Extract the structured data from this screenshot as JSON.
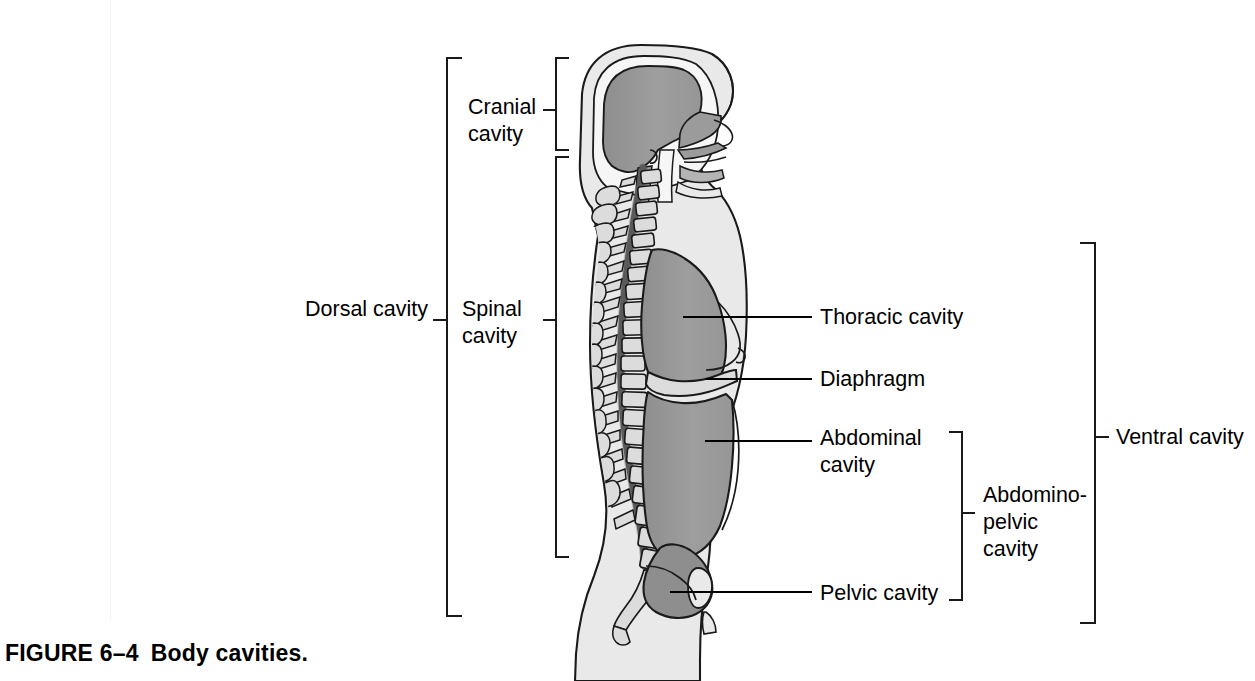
{
  "figure": {
    "caption_number": "FIGURE 6–4",
    "caption_title": "Body cavities."
  },
  "colors": {
    "background": "#ffffff",
    "body_fill": "#e9e9e9",
    "body_outline": "#1a1a1a",
    "cavity_fill": "#9b9b9b",
    "cavity_fill_dark": "#8e8e8e",
    "bone_fill": "#dcdcdc",
    "spinal_canal": "#6f6f6f",
    "label_text": "#000000",
    "leader_line": "#000000",
    "bracket_line": "#1a1a1a",
    "scan_artifact": "#f4f4f4"
  },
  "labels": {
    "dorsal_cavity": "Dorsal cavity",
    "cranial_cavity": "Cranial\ncavity",
    "spinal_cavity": "Spinal\ncavity",
    "thoracic_cavity": "Thoracic cavity",
    "diaphragm": "Diaphragm",
    "abdominal_cavity": "Abdominal\ncavity",
    "pelvic_cavity": "Pelvic cavity",
    "abdominopelvic_cavity": "Abdomino-\npelvic\ncavity",
    "ventral_cavity": "Ventral cavity"
  },
  "brackets": [
    {
      "name": "dorsal-cavity-bracket",
      "label": "Dorsal cavity",
      "side": "left",
      "x": 447,
      "y_top": 58,
      "y_bottom": 616,
      "tick_y": 320,
      "arm": 14
    },
    {
      "name": "cranial-cavity-bracket",
      "label": "Cranial cavity",
      "side": "left",
      "x": 556,
      "y_top": 58,
      "y_bottom": 150,
      "tick_y": 110,
      "arm": 12
    },
    {
      "name": "spinal-cavity-bracket",
      "label": "Spinal cavity",
      "side": "left",
      "x": 556,
      "y_top": 157,
      "y_bottom": 557,
      "tick_y": 320,
      "arm": 12
    },
    {
      "name": "abdominopelvic-cavity-bracket",
      "label": "Abdomino-pelvic cavity",
      "side": "right",
      "x": 962,
      "y_top": 432,
      "y_bottom": 600,
      "tick_y": 513,
      "arm": 12
    },
    {
      "name": "ventral-cavity-bracket",
      "label": "Ventral cavity",
      "side": "right",
      "x": 1095,
      "y_top": 243,
      "y_bottom": 623,
      "tick_y": 437,
      "arm": 14
    }
  ],
  "leader_lines": [
    {
      "name": "thoracic-cavity-leader",
      "x1": 683,
      "y1": 317,
      "x2": 812,
      "y2": 317
    },
    {
      "name": "diaphragm-leader",
      "x1": 706,
      "y1": 379,
      "x2": 812,
      "y2": 379
    },
    {
      "name": "abdominal-cavity-leader",
      "x1": 705,
      "y1": 441,
      "x2": 812,
      "y2": 441
    },
    {
      "name": "pelvic-cavity-leader",
      "x1": 670,
      "y1": 592,
      "x2": 812,
      "y2": 592
    }
  ],
  "label_positions": [
    {
      "name": "dorsal-cavity-label",
      "key": "dorsal_cavity",
      "x": 305,
      "y": 308,
      "align": "left"
    },
    {
      "name": "cranial-cavity-label",
      "key": "cranial_cavity",
      "x": 468,
      "y": 97,
      "align": "left"
    },
    {
      "name": "spinal-cavity-label",
      "key": "spinal_cavity",
      "x": 462,
      "y": 308,
      "align": "left"
    },
    {
      "name": "thoracic-cavity-label",
      "key": "thoracic_cavity",
      "x": 820,
      "y": 305,
      "align": "left"
    },
    {
      "name": "diaphragm-label",
      "key": "diaphragm",
      "x": 820,
      "y": 367,
      "align": "left"
    },
    {
      "name": "abdominal-cavity-label",
      "key": "abdominal_cavity",
      "x": 820,
      "y": 428,
      "align": "left"
    },
    {
      "name": "abdominopelvic-cavity-label",
      "key": "abdominopelvic_cavity",
      "x": 983,
      "y": 488,
      "align": "left"
    },
    {
      "name": "pelvic-cavity-label",
      "key": "pelvic_cavity",
      "x": 820,
      "y": 581,
      "align": "left"
    },
    {
      "name": "ventral-cavity-label",
      "key": "ventral_cavity",
      "x": 1116,
      "y": 425,
      "align": "left"
    }
  ],
  "anatomy_regions": [
    {
      "name": "cranial-cavity-region",
      "description": "Brain space inside the skull"
    },
    {
      "name": "spinal-cavity-region",
      "description": "Vertebral canal running the length of the spine"
    },
    {
      "name": "thoracic-cavity-region",
      "description": "Chest cavity above the diaphragm"
    },
    {
      "name": "diaphragm-region",
      "description": "Muscular sheet separating thoracic and abdominal cavities"
    },
    {
      "name": "abdominal-cavity-region",
      "description": "Cavity below diaphragm above the pelvis"
    },
    {
      "name": "pelvic-cavity-region",
      "description": "Cavity within the bony pelvis"
    },
    {
      "name": "vertebral-column",
      "description": "Stacked vertebrae with spinous processes"
    },
    {
      "name": "nasal-oral-passage",
      "description": "Nasal cavity, oral cavity and pharynx"
    }
  ]
}
